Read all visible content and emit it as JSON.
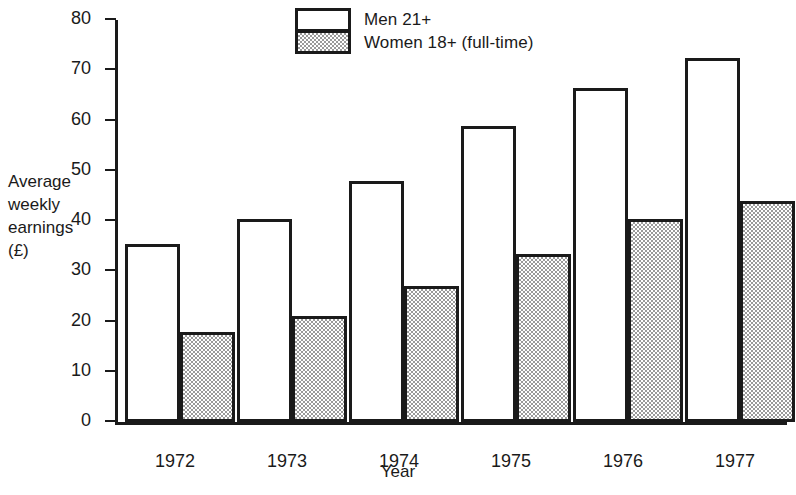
{
  "chart_data": {
    "type": "bar",
    "title": "",
    "categories": [
      "1972",
      "1973",
      "1974",
      "1975",
      "1976",
      "1977"
    ],
    "series": [
      {
        "name": "Men 21+",
        "values": [
          35.5,
          40.5,
          48.0,
          59.0,
          66.5,
          72.5
        ],
        "fill": "white"
      },
      {
        "name": "Women 18+ (full-time)",
        "values": [
          18.0,
          21.0,
          27.0,
          33.5,
          40.5,
          44.0
        ],
        "fill": "gray-stipple"
      }
    ],
    "xlabel": "Year",
    "ylabel": "Average weekly earnings (£)",
    "ylim": [
      0,
      80
    ],
    "yticks": [
      0,
      10,
      20,
      30,
      40,
      50,
      60,
      70,
      80
    ],
    "grid": false,
    "legend_position": "top-center"
  },
  "legend": {
    "entries": [
      {
        "label": "Men 21+"
      },
      {
        "label": "Women 18+ (full-time)"
      }
    ]
  },
  "axes": {
    "y_title_lines": [
      "Average",
      "weekly",
      "earnings",
      "(£)"
    ],
    "x_title": "Year"
  },
  "colors": {
    "ink": "#1a1a1a",
    "background": "#ffffff",
    "women_fill": "#9a9a9a"
  }
}
